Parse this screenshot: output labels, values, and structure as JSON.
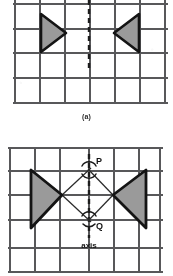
{
  "page": {
    "kind": "geometry-figure-scan",
    "background": "#ffffff",
    "width": 173,
    "height": 276
  },
  "style": {
    "grid_color": "#58585a",
    "grid_color_light": "#7d7d80",
    "shape_outline": "#141414",
    "shape_fill": "#9a9a9a",
    "construction_color": "#2b2b2b",
    "label_color": "#1a1a1a",
    "grid_step": 25
  },
  "figures": [
    {
      "id": "figure-a",
      "caption": "(a)",
      "caption_pos": {
        "x": 89,
        "y": 120
      },
      "grid": {
        "x": 15,
        "y": -6,
        "cols": 6,
        "rows": 4,
        "step": 25,
        "right": 165,
        "bottom": 103
      },
      "axis_line": {
        "name": "mirror-line",
        "x": 89,
        "y1": 0,
        "y2": 68,
        "dashed": true,
        "dash": "5 4",
        "width": 2.4
      },
      "shapes": [
        {
          "name": "left-triangle",
          "direction": "points-right",
          "points": "41,14 41,52 66,33",
          "fill": "#9a9a9a",
          "stroke": "#141414",
          "stroke_width": 2.6
        },
        {
          "name": "right-triangle",
          "direction": "points-left",
          "points": "139,14 139,52 114,33",
          "fill": "#9a9a9a",
          "stroke": "#141414",
          "stroke_width": 2.6
        }
      ],
      "labels": []
    },
    {
      "id": "figure-b",
      "caption": "",
      "grid": {
        "x": 10,
        "y": 10,
        "cols": 6,
        "rows": 5,
        "step": 25,
        "right": 160,
        "bottom": 135
      },
      "axis_line": {
        "name": "axis-of-symmetry",
        "x": 89,
        "y1": 18,
        "y2": 100,
        "dashed": true,
        "dash": "5 4",
        "width": 2.4
      },
      "shapes": [
        {
          "name": "left-triangle",
          "direction": "points-right",
          "points": "31,32 31,90 62,57",
          "fill": "#9a9a9a",
          "stroke": "#141414",
          "stroke_width": 2.6
        },
        {
          "name": "right-triangle",
          "direction": "points-left",
          "points": "146,32 146,90 113,57",
          "fill": "#9a9a9a",
          "stroke": "#141414",
          "stroke_width": 2.6
        }
      ],
      "construction_lines": [
        {
          "name": "line-left-apex-to-P",
          "x1": 62,
          "y1": 57,
          "x2": 89,
          "y2": 32
        },
        {
          "name": "line-right-apex-to-P",
          "x1": 113,
          "y1": 57,
          "x2": 89,
          "y2": 32
        },
        {
          "name": "line-left-apex-to-Q",
          "x1": 62,
          "y1": 57,
          "x2": 89,
          "y2": 82
        },
        {
          "name": "line-right-apex-to-Q",
          "x1": 113,
          "y1": 57,
          "x2": 89,
          "y2": 82
        }
      ],
      "arc_marks": [
        {
          "name": "arc-mark-P",
          "cx": 89,
          "cy": 32,
          "r": 7,
          "from": -150,
          "to": -30
        },
        {
          "name": "arc-mark-P2",
          "cx": 89,
          "cy": 32,
          "r": 7,
          "from": 30,
          "to": 150
        },
        {
          "name": "arc-mark-Q",
          "cx": 89,
          "cy": 82,
          "r": 7,
          "from": -150,
          "to": -30
        },
        {
          "name": "arc-mark-Q2",
          "cx": 89,
          "cy": 82,
          "r": 7,
          "from": 30,
          "to": 150
        }
      ],
      "labels": [
        {
          "name": "point-label-P",
          "text": "P",
          "x": 96,
          "y": 24,
          "size": 8,
          "bold": true
        },
        {
          "name": "point-label-Q",
          "text": "Q",
          "x": 96,
          "y": 87,
          "size": 8,
          "bold": true
        },
        {
          "name": "axis-label",
          "text": "axis",
          "x": 89,
          "y": 108,
          "size": 7.5,
          "bold": true,
          "anchor": "middle"
        }
      ]
    }
  ]
}
